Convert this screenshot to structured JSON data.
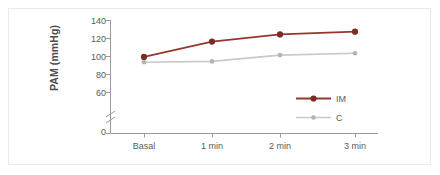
{
  "chart_data": {
    "type": "line",
    "title": "",
    "xlabel": "",
    "ylabel": "PAM (mmHg)",
    "categories": [
      "Basal",
      "1 min",
      "2 min",
      "3 min"
    ],
    "series": [
      {
        "name": "IM",
        "values": [
          99,
          116,
          124,
          127
        ],
        "color": "#96362f"
      },
      {
        "name": "C",
        "values": [
          93,
          94,
          101,
          103
        ],
        "color": "#c9c9c9"
      }
    ],
    "ylim": [
      0,
      140
    ],
    "yticks": [
      0,
      60,
      80,
      100,
      120,
      140
    ],
    "ytick_labels": [
      "0",
      "60",
      "80",
      "100",
      "120",
      "140"
    ],
    "axis_break": true,
    "axis_break_between": [
      0,
      60
    ],
    "grid": false,
    "legend_position": "center-right",
    "legend_entries": [
      "IM",
      "C"
    ],
    "axis_color": "#999999",
    "text_color": "#5a5a5a"
  },
  "figure": {
    "border_color": "#eaeaea",
    "background": "#ffffff"
  }
}
